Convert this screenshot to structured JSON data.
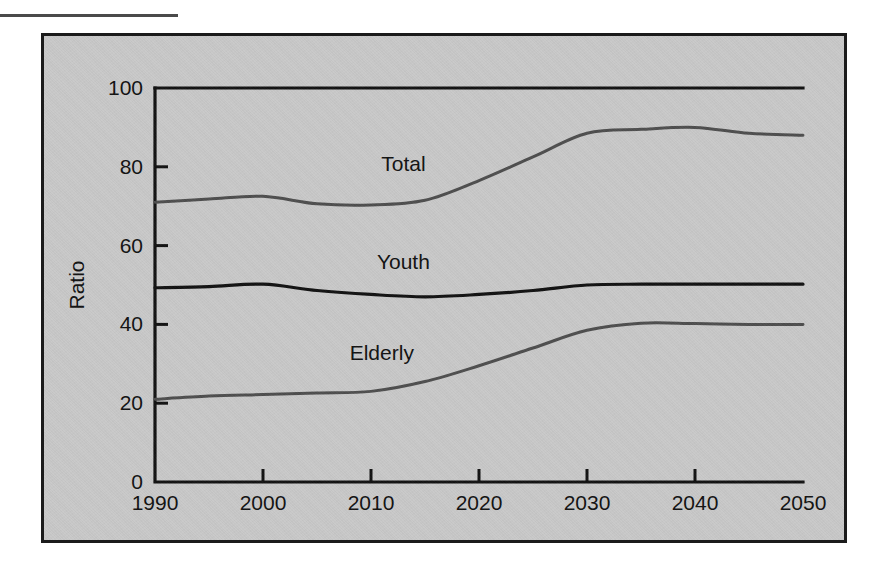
{
  "figure": {
    "panel_background": "#c9c9c9",
    "panel_border_color": "#1b1b1b",
    "page_background": "#ffffff",
    "rule_color": "#4a4a4a"
  },
  "chart_data": {
    "type": "line",
    "title": "",
    "subtitle": "",
    "xlabel": "",
    "ylabel": "Ratio",
    "xlim": [
      1990,
      2050
    ],
    "ylim": [
      0,
      100
    ],
    "ytick_labels": [
      "0",
      "20",
      "40",
      "60",
      "80",
      "100"
    ],
    "yticks": [
      0,
      20,
      40,
      60,
      80,
      100
    ],
    "xtick_labels": [
      "1990",
      "2000",
      "2010",
      "2020",
      "2030",
      "2040",
      "2050"
    ],
    "xticks": [
      1990,
      2000,
      2010,
      2020,
      2030,
      2040,
      2050
    ],
    "grid": false,
    "legend_position": "inline-labels",
    "x": [
      1990,
      1995,
      2000,
      2005,
      2010,
      2015,
      2020,
      2025,
      2030,
      2035,
      2040,
      2045,
      2050
    ],
    "series": [
      {
        "name": "Total",
        "color": "#4e4e4e",
        "stroke_width": 3.0,
        "label_x": 2013,
        "label_y": 79,
        "values": [
          71.0,
          71.8,
          72.5,
          70.6,
          70.3,
          71.5,
          76.5,
          82.5,
          88.5,
          89.5,
          90.0,
          88.5,
          88.0
        ]
      },
      {
        "name": "Youth",
        "color": "#111111",
        "stroke_width": 3.2,
        "label_x": 2013,
        "label_y": 54,
        "values": [
          49.3,
          49.6,
          50.2,
          48.6,
          47.6,
          47.0,
          47.6,
          48.6,
          50.0,
          50.2,
          50.2,
          50.2,
          50.2
        ]
      },
      {
        "name": "Elderly",
        "color": "#4e4e4e",
        "stroke_width": 3.0,
        "label_x": 2011,
        "label_y": 31,
        "values": [
          21.0,
          21.8,
          22.2,
          22.6,
          23.0,
          25.5,
          29.5,
          34.0,
          38.5,
          40.3,
          40.2,
          40.0,
          40.0
        ]
      }
    ],
    "annotations": [
      {
        "text": "Total",
        "x": 2013,
        "y": 79
      },
      {
        "text": "Youth",
        "x": 2013,
        "y": 54
      },
      {
        "text": "Elderly",
        "x": 2011,
        "y": 31
      }
    ]
  }
}
